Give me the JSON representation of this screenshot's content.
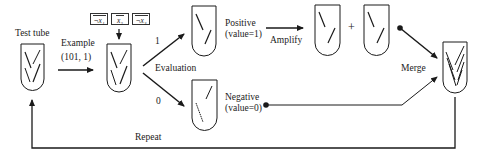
{
  "diagram": {
    "type": "dna-computing-evaluation-flow",
    "stroke_color": "#1a1a1a",
    "labels": {
      "test_tube": "Test tube",
      "example_title": "Example",
      "example_value": "(101, 1)",
      "branch_one": "1",
      "branch_zero": "0",
      "evaluation": "Evaluation",
      "positive_title": "Positive",
      "positive_value": "(value=1)",
      "negative_title": "Negative",
      "negative_value": "(value=0)",
      "amplify": "Amplify",
      "plus": "+",
      "merge": "Merge",
      "repeat": "Repeat"
    },
    "variables": [
      {
        "label": "¬x₁"
      },
      {
        "label": "x₂"
      },
      {
        "label": "¬x₃"
      }
    ],
    "nodes": [
      {
        "id": "test-tube",
        "label": "Test tube"
      },
      {
        "id": "example-tube",
        "label": "Example (101, 1)"
      },
      {
        "id": "positive-tube",
        "label": "Positive (value=1)"
      },
      {
        "id": "negative-tube",
        "label": "Negative (value=0)"
      },
      {
        "id": "amplified-tube-a",
        "label": "Amplify"
      },
      {
        "id": "amplified-tube-b",
        "label": "Amplify"
      },
      {
        "id": "merged-tube",
        "label": "Merge"
      }
    ],
    "edges": [
      {
        "from": "test-tube",
        "to": "example-tube",
        "label": "Example (101, 1)"
      },
      {
        "from": "example-tube",
        "to": "positive-tube",
        "label": "1"
      },
      {
        "from": "example-tube",
        "to": "negative-tube",
        "label": "0"
      },
      {
        "from": "positive-tube",
        "to": "amplified-tube-a",
        "label": "Amplify"
      },
      {
        "from": "amplified-tube-b",
        "to": "merged-tube",
        "label": "Merge"
      },
      {
        "from": "negative-tube",
        "to": "merged-tube",
        "label": "Merge"
      },
      {
        "from": "merged-tube",
        "to": "test-tube",
        "label": "Repeat"
      }
    ]
  }
}
